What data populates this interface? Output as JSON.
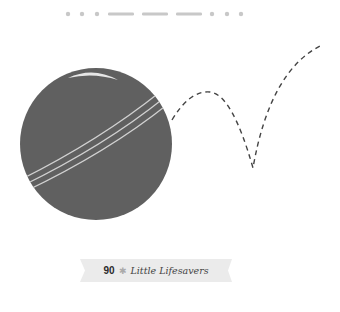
{
  "morse": {
    "pattern": [
      ".",
      ".",
      ".",
      "-",
      "-",
      "-",
      ".",
      ".",
      "."
    ],
    "meaning": "SOS",
    "color": "#c8c8c8"
  },
  "illustration": {
    "ball_color": "#606060",
    "stripe_color": "#d0d0d0",
    "highlight_color": "#e6e6e6",
    "path_color": "#444444"
  },
  "caption": {
    "count": "90",
    "separator_icon": "star-icon",
    "separator_glyph": "✱",
    "title": "Little Lifesavers",
    "ribbon_color": "#ebebeb"
  }
}
